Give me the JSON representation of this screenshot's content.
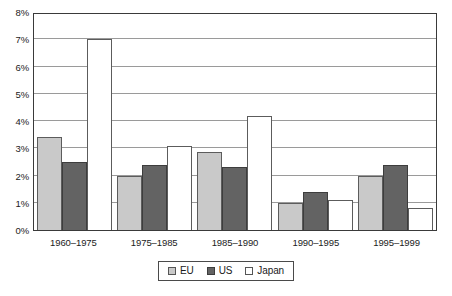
{
  "chart_data": {
    "type": "bar",
    "title": "",
    "subtitle": "",
    "xlabel": "",
    "ylabel": "",
    "categories": [
      "1960–1975",
      "1975–1985",
      "1985–1990",
      "1990–1995",
      "1995–1999"
    ],
    "series": [
      {
        "name": "EU",
        "color": "#c9c9c9",
        "values": [
          3.4,
          2.0,
          2.85,
          1.0,
          2.0
        ]
      },
      {
        "name": "US",
        "color": "#636363",
        "values": [
          2.5,
          2.4,
          2.3,
          1.4,
          2.4
        ]
      },
      {
        "name": "Japan",
        "color": "#ffffff",
        "values": [
          7.0,
          3.1,
          4.2,
          1.1,
          0.8
        ]
      }
    ],
    "ylim": [
      0,
      8
    ],
    "ytick_step": 1,
    "ytick_labels": [
      "8%",
      "7%",
      "6%",
      "5%",
      "4%",
      "3%",
      "2%",
      "1%",
      "0%"
    ],
    "ytick_values": [
      8,
      7,
      6,
      5,
      4,
      3,
      2,
      1,
      0
    ],
    "grid": true,
    "grid_axis": "y",
    "legend_position": "bottom",
    "legend_entries": [
      "EU",
      "US",
      "Japan"
    ],
    "value_unit": "percent",
    "bar_gap_within_group": 0,
    "frame_color": "#3a3a3a",
    "grid_color": "#9a9a9a"
  }
}
